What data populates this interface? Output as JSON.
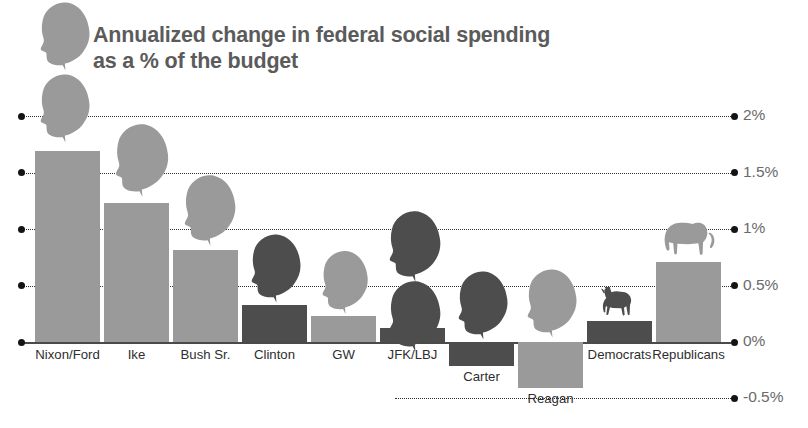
{
  "title": {
    "line1": "Annualized change in federal social spending",
    "line2": "as a % of the budget"
  },
  "colors": {
    "republican": "#9a9a9a",
    "democrat": "#4d4d4d",
    "axis_text": "#6a6a6a",
    "label_text": "#2e2e2e",
    "title_text": "#5b5b5b"
  },
  "axis": {
    "labels": [
      "2%",
      "1.5%",
      "1%",
      "0.5%",
      "0%",
      "-0.5%"
    ],
    "values": [
      2,
      1.5,
      1,
      0.5,
      0,
      -0.5
    ]
  },
  "chart_data": {
    "type": "bar",
    "title": "Annualized change in federal social spending as a % of the budget",
    "xlabel": "",
    "ylabel": "Annualized change as % of budget",
    "ylim": [
      -0.5,
      2
    ],
    "grid": true,
    "legend": "none",
    "ytick_labels": [
      "2%",
      "1.5%",
      "1%",
      "0.5%",
      "0%",
      "-0.5%"
    ],
    "yticks": [
      2,
      1.5,
      1,
      0.5,
      0,
      -0.5
    ],
    "categories": [
      "Nixon/Ford",
      "Ike",
      "Bush Sr.",
      "Clinton",
      "GW",
      "JFK/LBJ",
      "Carter",
      "Reagan",
      "Democrats",
      "Republicans"
    ],
    "values": [
      1.69,
      1.23,
      0.82,
      0.33,
      0.23,
      0.12,
      -0.21,
      -0.41,
      0.19,
      0.71
    ],
    "party": [
      "republican",
      "republican",
      "republican",
      "democrat",
      "republican",
      "democrat",
      "democrat",
      "republican",
      "democrat",
      "republican"
    ],
    "icons": [
      "head",
      "head",
      "head",
      "head",
      "head",
      "head",
      "head",
      "head",
      "donkey",
      "elephant"
    ]
  }
}
